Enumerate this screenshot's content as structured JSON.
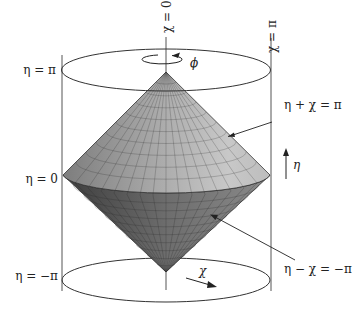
{
  "figure": {
    "labels": {
      "eta_pi": "η = π",
      "eta_zero": "η = 0",
      "eta_minus_pi": "η = −π",
      "chi_zero": "χ = 0",
      "chi_pi": "χ = π",
      "phi": "ϕ",
      "eta_axis": "η",
      "chi_axis": "χ",
      "future_cone": "η + χ = π",
      "past_cone": "η − χ = −π"
    },
    "colors": {
      "upper_cone": "#a8a8a8",
      "lower_cone": "#6a6a6a",
      "lines": "#333333",
      "grid": "#444444"
    }
  }
}
